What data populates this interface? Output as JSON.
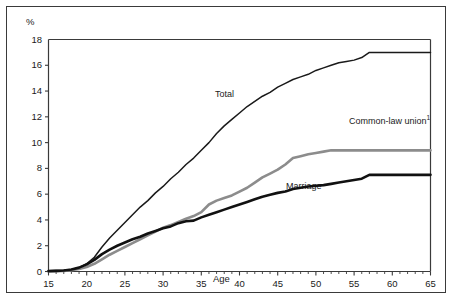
{
  "chart_data": {
    "type": "line",
    "title": "",
    "xlabel": "Age",
    "ylabel": "%",
    "xlim": [
      15,
      65
    ],
    "ylim": [
      0,
      18
    ],
    "xticks": [
      15,
      20,
      25,
      30,
      35,
      40,
      45,
      50,
      55,
      60,
      65
    ],
    "yticks": [
      0,
      2,
      4,
      6,
      8,
      10,
      12,
      14,
      16,
      18
    ],
    "grid": false,
    "legend_position": "inline-annotations",
    "minor_xticks_interval": 1,
    "series": [
      {
        "name": "Total",
        "color": "#1a1a1a",
        "stroke_width": 1.5,
        "annotation": "Total",
        "x": [
          15,
          16,
          17,
          18,
          19,
          20,
          21,
          22,
          23,
          24,
          25,
          26,
          27,
          28,
          29,
          30,
          31,
          32,
          33,
          34,
          35,
          36,
          37,
          38,
          39,
          40,
          41,
          42,
          43,
          44,
          45,
          46,
          47,
          48,
          49,
          50,
          51,
          52,
          53,
          54,
          55,
          56,
          57,
          58,
          59,
          60,
          61,
          62,
          63,
          64,
          65
        ],
        "values": [
          0.05,
          0.07,
          0.1,
          0.15,
          0.3,
          0.6,
          1.1,
          1.9,
          2.6,
          3.2,
          3.8,
          4.4,
          5.0,
          5.5,
          6.1,
          6.6,
          7.2,
          7.7,
          8.3,
          8.8,
          9.4,
          10.0,
          10.7,
          11.3,
          11.8,
          12.3,
          12.8,
          13.2,
          13.6,
          13.9,
          14.3,
          14.6,
          14.9,
          15.1,
          15.3,
          15.6,
          15.8,
          16.0,
          16.2,
          16.3,
          16.4,
          16.6,
          17.0,
          17.0,
          17.0,
          17.0,
          17.0,
          17.0,
          17.0,
          17.0,
          17.0
        ]
      },
      {
        "name": "Common-law union",
        "color": "#8c8c8c",
        "stroke_width": 2.6,
        "annotation": "Common-law union",
        "annotation_superscript": "1",
        "x": [
          15,
          16,
          17,
          18,
          19,
          20,
          21,
          22,
          23,
          24,
          25,
          26,
          27,
          28,
          29,
          30,
          31,
          32,
          33,
          34,
          35,
          36,
          37,
          38,
          39,
          40,
          41,
          42,
          43,
          44,
          45,
          46,
          47,
          48,
          49,
          50,
          51,
          52,
          53,
          54,
          55,
          56,
          57,
          58,
          59,
          60,
          61,
          62,
          63,
          64,
          65
        ],
        "values": [
          0.02,
          0.03,
          0.05,
          0.1,
          0.2,
          0.35,
          0.6,
          0.95,
          1.3,
          1.6,
          1.9,
          2.2,
          2.5,
          2.8,
          3.1,
          3.4,
          3.6,
          3.85,
          4.1,
          4.3,
          4.6,
          5.2,
          5.5,
          5.7,
          5.9,
          6.2,
          6.5,
          6.9,
          7.3,
          7.6,
          7.9,
          8.3,
          8.8,
          8.95,
          9.1,
          9.2,
          9.3,
          9.4,
          9.4,
          9.4,
          9.4,
          9.4,
          9.4,
          9.4,
          9.4,
          9.4,
          9.4,
          9.4,
          9.4,
          9.4,
          9.4
        ]
      },
      {
        "name": "Marriage",
        "color": "#111111",
        "stroke_width": 2.6,
        "annotation": "Marriage",
        "x": [
          15,
          16,
          17,
          18,
          19,
          20,
          21,
          22,
          23,
          24,
          25,
          26,
          27,
          28,
          29,
          30,
          31,
          32,
          33,
          34,
          35,
          36,
          37,
          38,
          39,
          40,
          41,
          42,
          43,
          44,
          45,
          46,
          47,
          48,
          49,
          50,
          51,
          52,
          53,
          54,
          55,
          56,
          57,
          58,
          59,
          60,
          61,
          62,
          63,
          64,
          65
        ],
        "values": [
          0.03,
          0.05,
          0.08,
          0.15,
          0.3,
          0.55,
          0.9,
          1.35,
          1.7,
          2.0,
          2.25,
          2.5,
          2.7,
          2.95,
          3.15,
          3.35,
          3.5,
          3.75,
          3.9,
          3.95,
          4.2,
          4.4,
          4.6,
          4.8,
          5.0,
          5.2,
          5.4,
          5.6,
          5.8,
          5.95,
          6.1,
          6.2,
          6.4,
          6.5,
          6.6,
          6.65,
          6.7,
          6.8,
          6.9,
          7.0,
          7.1,
          7.2,
          7.5,
          7.5,
          7.5,
          7.5,
          7.5,
          7.5,
          7.5,
          7.5,
          7.5
        ]
      }
    ]
  },
  "footnote_marker": "1"
}
